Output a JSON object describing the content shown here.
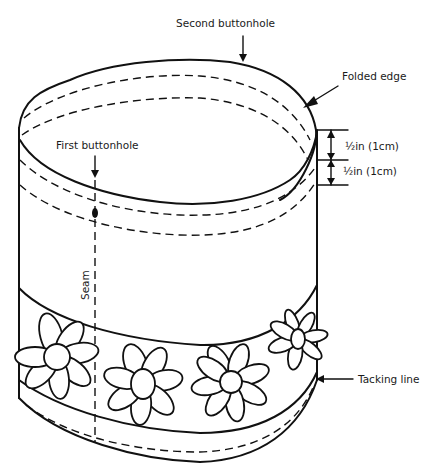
{
  "diagram": {
    "labels": {
      "second_buttonhole": "Second buttonhole",
      "folded_edge": "Folded edge",
      "first_buttonhole": "First buttonhole",
      "half_inch_1": "½in (1cm)",
      "half_inch_2": "½in (1cm)",
      "seam": "Seam",
      "tacking_line": "Tacking line"
    },
    "colors": {
      "ink": "#111111",
      "background": "#ffffff"
    }
  }
}
